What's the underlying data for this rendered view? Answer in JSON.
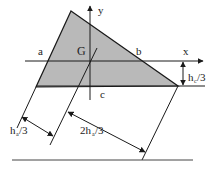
{
  "diagram": {
    "type": "triangle-centroid-geometry",
    "fill_color": "#b9b9b9",
    "line_color": "#1a1a1a",
    "labels": {
      "y_axis": "y",
      "x_axis": "x",
      "centroid": "G",
      "side_a": "a",
      "side_b": "b",
      "side_c": "c",
      "hc_main": "h",
      "hc_sub": "c",
      "hc_tail": "/3",
      "ha_left_main": "h",
      "ha_left_sub": "a",
      "ha_left_tail": "/3",
      "ha_right_prefix": "2h",
      "ha_right_sub": "a",
      "ha_right_tail": "/3"
    }
  }
}
